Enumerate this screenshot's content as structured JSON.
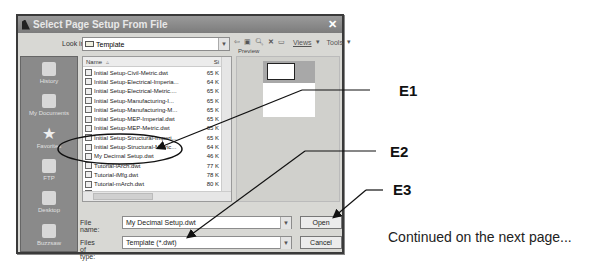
{
  "dialog": {
    "title": "Select Page Setup From File",
    "look_in_label": "Look in",
    "look_in_value": "Template",
    "toolbar": {
      "icons": [
        "back-icon",
        "up-folder-icon",
        "search-web-icon",
        "delete-icon",
        "new-folder-icon"
      ],
      "views_label": "Views",
      "tools_label": "Tools"
    },
    "places": [
      {
        "label": "History",
        "icon": "history-icon"
      },
      {
        "label": "My Documents",
        "icon": "my-documents-icon"
      },
      {
        "label": "Favorites",
        "icon": "favorites-icon"
      },
      {
        "label": "FTP",
        "icon": "ftp-icon"
      },
      {
        "label": "Desktop",
        "icon": "desktop-icon"
      },
      {
        "label": "Buzzsaw",
        "icon": "buzzsaw-icon"
      }
    ],
    "file_list": {
      "columns": [
        "Name",
        "Size"
      ],
      "header_name": "Name",
      "header_size": "Si",
      "files": [
        {
          "name": "Initial Setup-Civil-Metric.dwt",
          "size": "65 K"
        },
        {
          "name": "Initial Setup-Electrical-Imperia...",
          "size": "64 K"
        },
        {
          "name": "Initial Setup-Electrical-Metric....",
          "size": "65 K"
        },
        {
          "name": "Initial Setup-Manufacturing-I...",
          "size": "65 K"
        },
        {
          "name": "Initial Setup-Manufacturing-M...",
          "size": "65 K"
        },
        {
          "name": "Initial Setup-MEP-Imperial.dwt",
          "size": "65 K"
        },
        {
          "name": "Initial Setup-MEP-Metric.dwt",
          "size": "65 K"
        },
        {
          "name": "Initial Setup-Structural-Imperi...",
          "size": "65 K"
        },
        {
          "name": "Initial Setup-Structural-Metric...",
          "size": "64 K"
        },
        {
          "name": "My Decimal Setup.dwt",
          "size": "46 K"
        },
        {
          "name": "Tutorial-iArch.dwt",
          "size": "77 K"
        },
        {
          "name": "Tutorial-iMfg.dwt",
          "size": "78 K"
        },
        {
          "name": "Tutorial-mArch.dwt",
          "size": "80 K"
        },
        {
          "name": "Tutorial-mMfg.dwt",
          "size": "80 K"
        }
      ]
    },
    "preview_label": "Preview",
    "file_name_label": "File name:",
    "file_name_value": "My Decimal Setup.dwt",
    "files_of_type_label": "Files of type:",
    "files_of_type_value": "Template (*.dwt)",
    "open_button": "Open",
    "cancel_button": "Cancel"
  },
  "annotations": {
    "e1": "E1",
    "e2": "E2",
    "e3": "E3"
  },
  "footer_text": "Continued on the next page..."
}
